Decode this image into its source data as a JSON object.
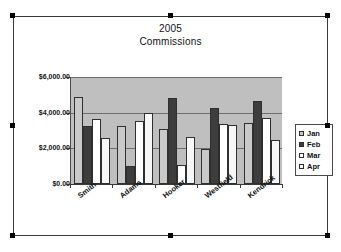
{
  "chart_data": {
    "type": "bar",
    "title": "2005 Commissions",
    "title_line1": "2005",
    "title_line2": "Commissions",
    "categories": [
      "Smith",
      "Adams",
      "Hooker",
      "Westfield",
      "Kendrick"
    ],
    "series": [
      {
        "name": "Jan",
        "color": "#c9c9c9",
        "values": [
          4900,
          3250,
          3100,
          1950,
          3400
        ]
      },
      {
        "name": "Feb",
        "color": "#3d3d3d",
        "values": [
          3250,
          1000,
          4850,
          4250,
          4650
        ]
      },
      {
        "name": "Mar",
        "color": "#ffffff",
        "values": [
          3650,
          3550,
          1050,
          3350,
          3700
        ]
      },
      {
        "name": "Apr",
        "color": "#f7f7f7",
        "values": [
          2600,
          4000,
          2650,
          3300,
          2450
        ]
      }
    ],
    "xlabel": "",
    "ylabel": "",
    "ylim": [
      0,
      6000
    ],
    "ytick_values": [
      0,
      2000,
      4000,
      6000
    ],
    "ytick_labels": [
      "$0.00",
      "$2,000.00",
      "$4,000.00",
      "$6,000.00"
    ],
    "grid": true,
    "legend_position": "right",
    "plot_background": "#bfbfbf",
    "chart_background": "#ffffff"
  },
  "selection": {
    "selected": true,
    "handle_color": "#000000"
  }
}
